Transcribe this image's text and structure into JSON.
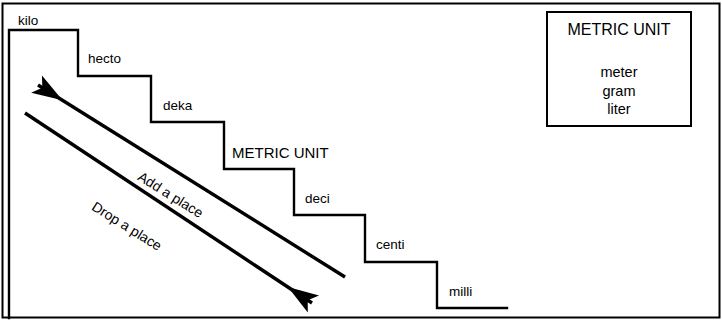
{
  "diagram": {
    "stroke_color": "#000000",
    "background_color": "#ffffff",
    "border": {
      "name": "outer-frame"
    },
    "steps": [
      {
        "id": "kilo",
        "label": "kilo",
        "x": 18,
        "y": 14,
        "size": "normal"
      },
      {
        "id": "hecto",
        "label": "hecto",
        "x": 88,
        "y": 52,
        "size": "normal"
      },
      {
        "id": "deka",
        "label": "deka",
        "x": 163,
        "y": 99,
        "size": "normal"
      },
      {
        "id": "metric-unit",
        "label": "METRIC UNIT",
        "x": 232,
        "y": 145,
        "size": "large"
      },
      {
        "id": "deci",
        "label": "deci",
        "x": 305,
        "y": 192,
        "size": "normal"
      },
      {
        "id": "centi",
        "label": "centi",
        "x": 376,
        "y": 238,
        "size": "normal"
      },
      {
        "id": "milli",
        "label": "milli",
        "x": 449,
        "y": 285,
        "size": "normal"
      }
    ],
    "staircase_path": "M 9,30 L 9,318 M 9,30 L 78,30 L 78,76 L 151,76 L 151,122 L 224,122 L 224,169 L 294,169 L 294,215 L 365,215 L 365,262 L 437,262 L 437,308 L 507,308",
    "arrows": [
      {
        "id": "add-a-place",
        "label": "Add a place",
        "direction": "up-left",
        "label_x": 143,
        "label_y": 169,
        "label_rotation": 32,
        "x1": 345,
        "y1": 277,
        "x2": 38,
        "y2": 85
      },
      {
        "id": "drop-a-place",
        "label": "Drop a place",
        "direction": "down-right",
        "label_x": 97,
        "label_y": 199,
        "label_rotation": 32,
        "x1": 25,
        "y1": 113,
        "x2": 312,
        "y2": 303
      }
    ],
    "metric_unit_box": {
      "title": "METRIC UNIT",
      "units": [
        "meter",
        "gram",
        "liter"
      ]
    }
  }
}
